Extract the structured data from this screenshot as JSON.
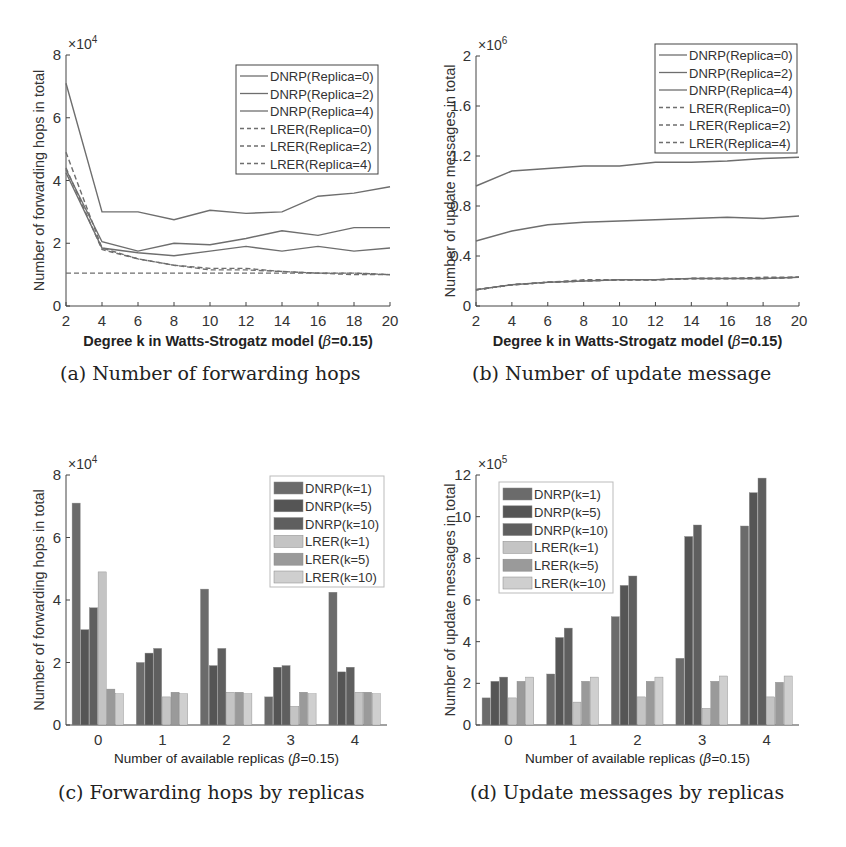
{
  "figure": {
    "captions": [
      "(a) Number of forwarding hops",
      "(b) Number of update message",
      "(c) Forwarding hops by replicas",
      "(d) Update messages by replicas"
    ]
  },
  "colors": {
    "axis": "#444444",
    "line": "#6e6e6e",
    "dnrp_k1": "#6b6b6b",
    "dnrp_k5": "#555555",
    "dnrp_k10": "#5f5f5f",
    "lrer_k1": "#c4c4c4",
    "lrer_k5": "#9a9a9a",
    "lrer_k10": "#cfcfcf"
  },
  "chart_data": [
    {
      "id": "a",
      "type": "line",
      "title": "",
      "caption": "(a) Number of forwarding hops",
      "xlabel": "Degree k in Watts-Strogatz model (β=0.15)",
      "ylabel": "Number of forwarding hops in total",
      "y_multiplier": "×10^4",
      "x": [
        2,
        4,
        6,
        8,
        10,
        12,
        14,
        16,
        18,
        20
      ],
      "xlim": [
        2,
        20
      ],
      "ylim": [
        0,
        8
      ],
      "yticks": [
        0,
        2,
        4,
        6,
        8
      ],
      "xticks": [
        2,
        4,
        6,
        8,
        10,
        12,
        14,
        16,
        18,
        20
      ],
      "legend_position": "upper right",
      "grid": false,
      "series": [
        {
          "name": "DNRP(Replica=0)",
          "style": "solid",
          "values": [
            7.1,
            3.0,
            3.0,
            2.75,
            3.05,
            2.95,
            3.0,
            3.5,
            3.6,
            3.8
          ]
        },
        {
          "name": "DNRP(Replica=2)",
          "style": "solid",
          "values": [
            4.35,
            2.05,
            1.75,
            2.0,
            1.95,
            2.15,
            2.4,
            2.25,
            2.5,
            2.5
          ]
        },
        {
          "name": "DNRP(Replica=4)",
          "style": "solid",
          "values": [
            4.25,
            1.85,
            1.7,
            1.6,
            1.75,
            1.9,
            1.75,
            1.9,
            1.75,
            1.85
          ]
        },
        {
          "name": "LRER(Replica=0)",
          "style": "dashed",
          "values": [
            4.9,
            1.85,
            1.5,
            1.3,
            1.2,
            1.2,
            1.1,
            1.05,
            1.05,
            1.0
          ]
        },
        {
          "name": "LRER(Replica=2)",
          "style": "dashed",
          "values": [
            4.4,
            1.8,
            1.5,
            1.3,
            1.15,
            1.15,
            1.1,
            1.05,
            1.05,
            1.0
          ]
        },
        {
          "name": "LRER(Replica=4)",
          "style": "dashed",
          "values": [
            1.05,
            1.05,
            1.05,
            1.05,
            1.05,
            1.05,
            1.05,
            1.05,
            1.0,
            1.0
          ]
        }
      ]
    },
    {
      "id": "b",
      "type": "line",
      "title": "",
      "caption": "(b) Number of update message",
      "xlabel": "Degree k in Watts-Strogatz model (β=0.15)",
      "ylabel": "Number of update messages in total",
      "y_multiplier": "×10^6",
      "x": [
        2,
        4,
        6,
        8,
        10,
        12,
        14,
        16,
        18,
        20
      ],
      "xlim": [
        2,
        20
      ],
      "ylim": [
        0,
        2
      ],
      "yticks": [
        0,
        0.4,
        0.8,
        1.2,
        1.6,
        2
      ],
      "xticks": [
        2,
        4,
        6,
        8,
        10,
        12,
        14,
        16,
        18,
        20
      ],
      "legend_position": "upper right",
      "grid": false,
      "series": [
        {
          "name": "DNRP(Replica=0)",
          "style": "solid",
          "values": [
            0.96,
            1.08,
            1.1,
            1.12,
            1.12,
            1.15,
            1.15,
            1.16,
            1.18,
            1.19
          ]
        },
        {
          "name": "DNRP(Replica=2)",
          "style": "solid",
          "values": [
            0.52,
            0.6,
            0.65,
            0.67,
            0.68,
            0.69,
            0.7,
            0.71,
            0.7,
            0.72
          ]
        },
        {
          "name": "DNRP(Replica=4)",
          "style": "solid",
          "values": [
            0.13,
            0.17,
            0.19,
            0.2,
            0.21,
            0.21,
            0.22,
            0.22,
            0.22,
            0.23
          ]
        },
        {
          "name": "LRER(Replica=0)",
          "style": "dashed",
          "values": [
            0.13,
            0.17,
            0.19,
            0.21,
            0.21,
            0.21,
            0.22,
            0.22,
            0.23,
            0.23
          ]
        },
        {
          "name": "LRER(Replica=2)",
          "style": "dashed",
          "values": [
            0.13,
            0.17,
            0.19,
            0.2,
            0.21,
            0.21,
            0.22,
            0.22,
            0.22,
            0.23
          ]
        },
        {
          "name": "LRER(Replica=4)",
          "style": "dashed",
          "values": [
            0.13,
            0.17,
            0.19,
            0.2,
            0.21,
            0.21,
            0.22,
            0.22,
            0.22,
            0.23
          ]
        }
      ]
    },
    {
      "id": "c",
      "type": "bar",
      "title": "",
      "caption": "(c) Forwarding hops by replicas",
      "xlabel": "Number of available replicas (β=0.15)",
      "ylabel": "Number of forwarding hops in total",
      "y_multiplier": "×10^4",
      "categories": [
        "0",
        "1",
        "2",
        "3",
        "4"
      ],
      "ylim": [
        0,
        8
      ],
      "yticks": [
        0,
        2,
        4,
        6,
        8
      ],
      "legend_position": "upper right",
      "grid": false,
      "series": [
        {
          "name": "DNRP(k=1)",
          "color_key": "dnrp_k1",
          "values": [
            7.1,
            2.0,
            4.35,
            0.9,
            4.25
          ]
        },
        {
          "name": "DNRP(k=5)",
          "color_key": "dnrp_k5",
          "values": [
            3.05,
            2.3,
            1.9,
            1.85,
            1.7
          ]
        },
        {
          "name": "DNRP(k=10)",
          "color_key": "dnrp_k10",
          "values": [
            3.75,
            2.45,
            2.45,
            1.9,
            1.85
          ]
        },
        {
          "name": "LRER(k=1)",
          "color_key": "lrer_k1",
          "values": [
            4.9,
            0.9,
            1.05,
            0.6,
            1.05
          ]
        },
        {
          "name": "LRER(k=5)",
          "color_key": "lrer_k5",
          "values": [
            1.15,
            1.05,
            1.05,
            1.05,
            1.05
          ]
        },
        {
          "name": "LRER(k=10)",
          "color_key": "lrer_k10",
          "values": [
            1.0,
            1.0,
            1.0,
            1.0,
            1.0
          ]
        }
      ]
    },
    {
      "id": "d",
      "type": "bar",
      "title": "",
      "caption": "(d) Update messages by replicas",
      "xlabel": "Number of available replicas (β=0.15)",
      "ylabel": "Number of update messages in total",
      "y_multiplier": "×10^5",
      "categories": [
        "0",
        "1",
        "2",
        "3",
        "4"
      ],
      "ylim": [
        0,
        12
      ],
      "yticks": [
        0,
        2,
        4,
        6,
        8,
        10,
        12
      ],
      "legend_position": "upper left",
      "grid": false,
      "series": [
        {
          "name": "DNRP(k=1)",
          "color_key": "dnrp_k1",
          "values": [
            1.3,
            2.45,
            5.2,
            3.2,
            9.55
          ]
        },
        {
          "name": "DNRP(k=5)",
          "color_key": "dnrp_k5",
          "values": [
            2.1,
            4.2,
            6.7,
            9.05,
            11.15
          ]
        },
        {
          "name": "DNRP(k=10)",
          "color_key": "dnrp_k10",
          "values": [
            2.3,
            4.65,
            7.15,
            9.6,
            11.85
          ]
        },
        {
          "name": "LRER(k=1)",
          "color_key": "lrer_k1",
          "values": [
            1.3,
            1.1,
            1.35,
            0.8,
            1.35
          ]
        },
        {
          "name": "LRER(k=5)",
          "color_key": "lrer_k5",
          "values": [
            2.1,
            2.1,
            2.1,
            2.1,
            2.05
          ]
        },
        {
          "name": "LRER(k=10)",
          "color_key": "lrer_k10",
          "values": [
            2.3,
            2.3,
            2.3,
            2.35,
            2.35
          ]
        }
      ]
    }
  ]
}
